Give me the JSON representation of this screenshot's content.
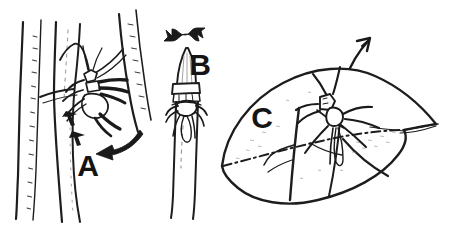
{
  "figure": {
    "title": "Hand-drawn line illustration of an insect at three plant sites",
    "background_color": "#ffffff",
    "ink_color": "#1a1a1a",
    "stipple_color": "#8a8a8a",
    "width": 464,
    "height": 227,
    "style": "pen-and-ink scientific drawing"
  },
  "panels": [
    {
      "id": "A",
      "label": "A",
      "label_x": 88,
      "label_y": 176,
      "label_size": 30,
      "caption": "Insect on forked woody stem, arrow indicating downward movement",
      "subject": "insect-on-stem",
      "arrow": {
        "name": "thick-curved-arrow",
        "direction": "down-left",
        "style": "solid-tapered"
      }
    },
    {
      "id": "B",
      "label": "B",
      "label_x": 200,
      "label_y": 75,
      "label_size": 30,
      "caption": "Insect at shoot tip / terminal bud, double-headed wavy arrow above",
      "subject": "insect-on-bud",
      "arrow": {
        "name": "wavy-double-arrow",
        "direction": "horizontal",
        "style": "solid-wavy"
      }
    },
    {
      "id": "C",
      "label": "C",
      "label_x": 262,
      "label_y": 128,
      "label_size": 30,
      "caption": "Insect on leaf midrib with lateral veins, thin arrow pointing up-right",
      "subject": "insect-on-leaf",
      "arrow": {
        "name": "thin-arrow",
        "direction": "up-right",
        "style": "thin-line"
      }
    }
  ]
}
